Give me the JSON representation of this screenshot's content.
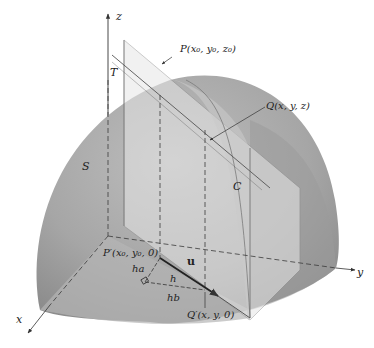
{
  "figure": {
    "axes": {
      "x_label": "x",
      "y_label": "y",
      "z_label": "z"
    },
    "labels": {
      "surface": "S",
      "plane": "T",
      "curve": "C",
      "point_P": "P(x₀, y₀, z₀)",
      "point_Q": "Q(x, y, z)",
      "point_P_prime": "P′(x₀, y₀, 0)",
      "point_Q_prime": "Q′(x, y, 0)",
      "vector_u": "u",
      "segment_h": "h",
      "segment_ha": "ha",
      "segment_hb": "hb"
    },
    "colors": {
      "surface_dark": "#8e8e8e",
      "surface_light": "#c4c4c4",
      "plane_fill": "#e2e2e2",
      "axis_line": "#333333",
      "dashed_line": "#3a3a3a",
      "background": "#ffffff"
    }
  }
}
